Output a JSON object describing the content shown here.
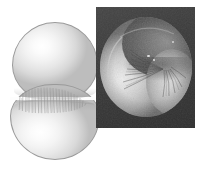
{
  "figure": {
    "background_color": "#ffffff",
    "width": 213,
    "height": 175,
    "panels": [
      {
        "id": "illustration",
        "label": "Illustration of a dividing cell",
        "description": "Shaded drawing of a cell constricting into two daughter lobes, with a striated cleavage furrow at the equator",
        "style": "line-and-tone illustration",
        "parts": [
          {
            "name": "upper-lobe",
            "label": "Upper daughter cell"
          },
          {
            "name": "lower-lobe",
            "label": "Lower daughter cell"
          },
          {
            "name": "cleavage-furrow",
            "label": "Cleavage furrow"
          }
        ],
        "colors": {
          "fill_light": "#ffffff",
          "fill_mid": "#e6e6e6",
          "fill_shadow": "#bdbdbd",
          "outline": "#9a9a9a",
          "furrow_line": "#8b8b8b"
        }
      },
      {
        "id": "micrograph",
        "label": "Scanning electron micrograph of a dividing cell",
        "description": "SEM image on a dark field showing the contractile ring constriction with radiating surface folds",
        "style": "scanning electron micrograph",
        "parts": [
          {
            "name": "left-lobe",
            "label": "Left daughter cell"
          },
          {
            "name": "right-lobe",
            "label": "Right daughter cell"
          },
          {
            "name": "furrow-folds",
            "label": "Radiating membrane folds"
          }
        ],
        "colors": {
          "panel_background": "#3a3a3a",
          "cell_light": "#f0f0f0",
          "cell_mid": "#b0b0b0",
          "cell_dark": "#525252",
          "groove": "#282828"
        }
      }
    ]
  }
}
